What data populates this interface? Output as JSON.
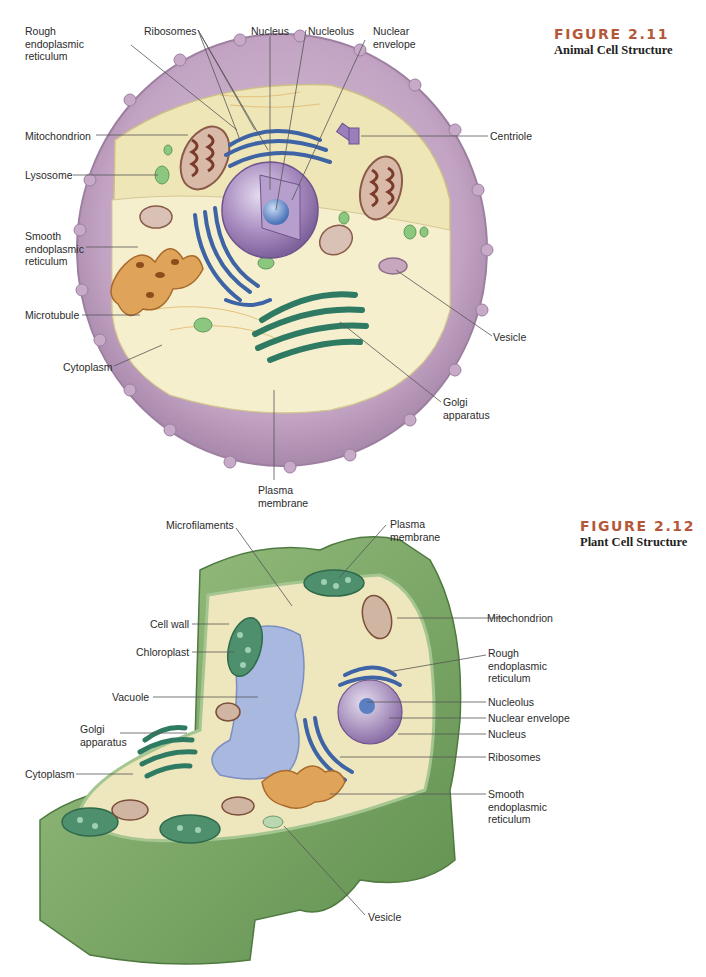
{
  "figures": [
    {
      "number": "FIGURE 2.11",
      "title": "Animal Cell Structure",
      "labels": {
        "rough_er": "Rough\nendoplasmic\nreticulum",
        "ribosomes": "Ribosomes",
        "nucleus": "Nucleus",
        "nucleolus": "Nucleolus",
        "nuclear_envelope": "Nuclear\nenvelope",
        "mitochondrion": "Mitochondrion",
        "centriole": "Centriole",
        "lysosome": "Lysosome",
        "smooth_er": "Smooth\nendoplasmic\nreticulum",
        "microtubule": "Microtubule",
        "vesicle": "Vesicle",
        "cytoplasm": "Cytoplasm",
        "golgi": "Golgi\napparatus",
        "plasma_membrane": "Plasma\nmembrane"
      }
    },
    {
      "number": "FIGURE 2.12",
      "title": "Plant Cell Structure",
      "labels": {
        "microfilaments": "Microfilaments",
        "plasma_membrane": "Plasma\nmembrane",
        "cell_wall": "Cell wall",
        "mitochondrion": "Mitochondrion",
        "chloroplast": "Chloroplast",
        "rough_er": "Rough\nendoplasmic\nreticulum",
        "vacuole": "Vacuole",
        "nucleolus": "Nucleolus",
        "nuclear_envelope": "Nuclear envelope",
        "golgi": "Golgi\napparatus",
        "nucleus": "Nucleus",
        "ribosomes": "Ribosomes",
        "cytoplasm": "Cytoplasm",
        "smooth_er": "Smooth\nendoplasmic\nreticulum",
        "vesicle": "Vesicle"
      }
    }
  ],
  "colors": {
    "caption_accent": "#b5583a",
    "animal_membrane": "#c3a6c4",
    "animal_cytoplasm": "#f1ebc2",
    "nucleus": "#a88cc0",
    "rough_er": "#5f86c4",
    "smooth_er": "#d99a4e",
    "golgi": "#4f9a80",
    "plant_wall": "#7aa664",
    "vacuole": "#9fb1dc"
  }
}
